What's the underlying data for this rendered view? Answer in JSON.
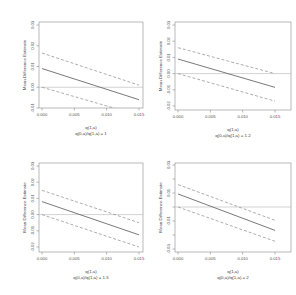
{
  "figure": {
    "layout": "2x2 grid",
    "panel_count": 4
  },
  "chart_data": [
    {
      "type": "line",
      "title": "",
      "xlabel": "q(1,a)",
      "subtitle": "q(0,a)/q(1,a) = 1",
      "ylabel": "Mean Difference Estimate",
      "x_ticks": [
        "0.000",
        "0.005",
        "0.010",
        "0.015"
      ],
      "y_ticks": [
        "0.03",
        "0.02",
        "0.01",
        "0.00",
        "-0.01"
      ],
      "xlim": [
        0.0,
        0.015
      ],
      "ylim": [
        -0.01,
        0.03
      ],
      "reference_line_y": 0.0,
      "x": [
        0.0,
        0.015
      ],
      "series": [
        {
          "name": "upper bound",
          "style": "dashed",
          "values": [
            0.0165,
            0.001
          ]
        },
        {
          "name": "estimate",
          "style": "solid",
          "values": [
            0.009,
            -0.006
          ]
        },
        {
          "name": "lower bound",
          "style": "dashed",
          "values": [
            0.0,
            -0.0135
          ]
        }
      ],
      "grid": false
    },
    {
      "type": "line",
      "title": "",
      "xlabel": "q(1,a)",
      "subtitle": "q(0,a)/q(1,a) = 1.2",
      "ylabel": "Mean Difference Estimate",
      "x_ticks": [
        "0.000",
        "0.005",
        "0.010",
        "0.015"
      ],
      "y_ticks": [
        "0.03",
        "0.02",
        "0.01",
        "0.00",
        "-0.01",
        "-0.02"
      ],
      "xlim": [
        0.0,
        0.015
      ],
      "ylim": [
        -0.02,
        0.03
      ],
      "reference_line_y": 0.0,
      "x": [
        0.0,
        0.015
      ],
      "series": [
        {
          "name": "upper bound",
          "style": "dashed",
          "values": [
            0.016,
            0.0
          ]
        },
        {
          "name": "estimate",
          "style": "solid",
          "values": [
            0.009,
            -0.0085
          ]
        },
        {
          "name": "lower bound",
          "style": "dashed",
          "values": [
            0.0,
            -0.017
          ]
        }
      ],
      "grid": false
    },
    {
      "type": "line",
      "title": "",
      "xlabel": "q(1,a)",
      "subtitle": "q(0,a)/q(1,a) = 1.5",
      "ylabel": "Mean Difference Estimate",
      "x_ticks": [
        "0.000",
        "0.005",
        "0.010",
        "0.015"
      ],
      "y_ticks": [
        "0.03",
        "0.02",
        "0.01",
        "0.00",
        "-0.01",
        "-0.02"
      ],
      "xlim": [
        0.0,
        0.015
      ],
      "ylim": [
        -0.02,
        0.03
      ],
      "reference_line_y": 0.0,
      "x": [
        0.0,
        0.015
      ],
      "series": [
        {
          "name": "upper bound",
          "style": "dashed",
          "values": [
            0.015,
            -0.005
          ]
        },
        {
          "name": "estimate",
          "style": "solid",
          "values": [
            0.008,
            -0.0125
          ]
        },
        {
          "name": "lower bound",
          "style": "dashed",
          "values": [
            0.0,
            -0.02
          ]
        }
      ],
      "grid": false
    },
    {
      "type": "line",
      "title": "",
      "xlabel": "q(1,a)",
      "subtitle": "q(0,a)/q(1,a) = 2",
      "ylabel": "Mean Difference Estimate",
      "x_ticks": [
        "0.000",
        "0.005",
        "0.010",
        "0.015"
      ],
      "y_ticks": [
        "0.03",
        "0.01",
        "-0.01",
        "-0.03"
      ],
      "xlim": [
        0.0,
        0.015
      ],
      "ylim": [
        -0.03,
        0.03
      ],
      "reference_line_y": 0.0,
      "x": [
        0.0,
        0.015
      ],
      "series": [
        {
          "name": "upper bound",
          "style": "dashed",
          "values": [
            0.016,
            -0.0095
          ]
        },
        {
          "name": "estimate",
          "style": "solid",
          "values": [
            0.0093,
            -0.0167
          ]
        },
        {
          "name": "lower bound",
          "style": "dashed",
          "values": [
            0.0,
            -0.0245
          ]
        }
      ],
      "grid": false
    }
  ],
  "panels": [
    {
      "xlabel": "q(1,a)",
      "subtitle": "q(0,a)/q(1,a) = 1",
      "ylabel": "Mean Difference Estimate"
    },
    {
      "xlabel": "q(1,a)",
      "subtitle": "q(0,a)/q(1,a) = 1.2",
      "ylabel": "Mean Difference Estimate"
    },
    {
      "xlabel": "q(1,a)",
      "subtitle": "q(0,a)/q(1,a) = 1.5",
      "ylabel": "Mean Difference Estimate"
    },
    {
      "xlabel": "q(1,a)",
      "subtitle": "q(0,a)/q(1,a) = 2",
      "ylabel": "Mean Difference Estimate"
    }
  ]
}
